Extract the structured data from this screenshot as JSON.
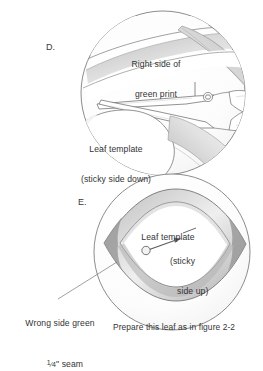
{
  "figure": {
    "type": "instructional-line-drawing",
    "title_text": "",
    "panels": [
      {
        "letter": "D.",
        "labels": [
          {
            "name": "right-side-green-print",
            "lines": [
              "Right side of",
              "green print"
            ]
          },
          {
            "name": "leaf-template-sticky-down",
            "lines": [
              "Leaf template",
              "(sticky side down)"
            ]
          }
        ],
        "objects": [
          "scissors",
          "fabric",
          "leaf-template"
        ]
      },
      {
        "letter": "E.",
        "labels": [
          {
            "name": "leaf-template",
            "lines": [
              "Leaf template"
            ]
          },
          {
            "name": "sticky-side-up",
            "lines": [
              "(sticky",
              "side up)"
            ]
          },
          {
            "name": "wrong-side-green-seam",
            "lines": [
              "Wrong side green",
              "1/4\" seam"
            ]
          }
        ],
        "objects": [
          "leaf-shape",
          "seam-allowance",
          "pin"
        ]
      }
    ],
    "caption": "Prepare this leaf as in figure 2-2",
    "seam_numerator": "1",
    "seam_denominator": "4",
    "seam_suffix": "\" seam",
    "seam_prefix": "",
    "colors": {
      "ink": "#4a4a4a",
      "shade_light": "#e8e8e8",
      "shade_mid": "#c9c9c9",
      "shade_dark": "#a0a0a0",
      "text": "#333333",
      "background": "#ffffff"
    }
  }
}
